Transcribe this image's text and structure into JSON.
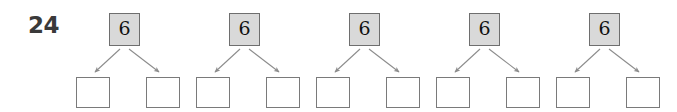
{
  "worksheet": {
    "problem_number": "24",
    "background_color": "#ffffff",
    "whole_box_fill": "#d9d9d9",
    "whole_box_border": "#6e6e6e",
    "part_box_fill": "#ffffff",
    "part_box_border": "#7a7a7a",
    "arrow_color": "#8c8c8c",
    "number_color": "#111111",
    "problem_number_color": "#3a3a3a",
    "bonds": [
      {
        "whole": "6",
        "parts": [
          "",
          ""
        ]
      },
      {
        "whole": "6",
        "parts": [
          "",
          ""
        ]
      },
      {
        "whole": "6",
        "parts": [
          "",
          ""
        ]
      },
      {
        "whole": "6",
        "parts": [
          "",
          ""
        ]
      },
      {
        "whole": "6",
        "parts": [
          "",
          ""
        ]
      }
    ]
  }
}
